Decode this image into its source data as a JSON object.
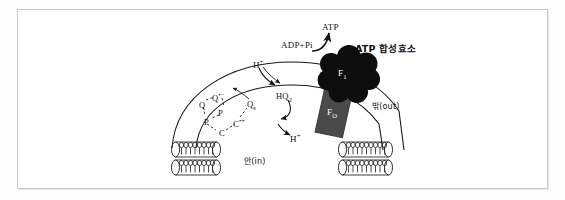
{
  "figure": {
    "frame": {
      "border_color": "#c9c9c9",
      "background": "#ffffff"
    }
  },
  "labels": {
    "atp": "ATP",
    "adp_pi": "ADP+Pi",
    "atp_synthase": "ATP 합성효소",
    "f1": "F",
    "f1_sub": "1",
    "f0": "F",
    "f0_sub": "O",
    "h_plus_top": "H",
    "h_plus_top_sup": "+",
    "h_plus_bottom": "H",
    "h_plus_bottom_sup": "+",
    "hq2": "HQ",
    "hq2_sub": "2",
    "qs": "Q",
    "qs_sub": "s",
    "q": "Q",
    "q_radical": "Q",
    "q_radical_sup": "•−",
    "p_upper": "P",
    "p_lower": "P",
    "c": "C",
    "c_radical": "C",
    "c_radical_sup": "•+",
    "outside": "밖(out)",
    "inside": "안(in)"
  },
  "colors": {
    "f1_fill": "#0d0d0d",
    "f0_fill": "#4a4a4a",
    "stroke": "#1a1a1a",
    "membrane_stroke": "#2b2b2b",
    "frame": "#c9c9c9",
    "background": "#ffffff",
    "label_text": "#111111",
    "label_text_on_dark": "#ffffff"
  },
  "diagram": {
    "type": "biology-membrane-schematic",
    "components": [
      "outer-membrane-arc",
      "inner-membrane-arc",
      "lipid-bilayer-left",
      "lipid-bilayer-right",
      "atp-synthase-f1-head",
      "atp-synthase-f0-stalk",
      "q-cycle-electron-chain",
      "proton-flow-arrows",
      "atp-synthesis-arrow"
    ],
    "q_cycle_chain": [
      "Q",
      "Q•−",
      "P",
      "P",
      "C",
      "C•+",
      "Qs",
      "HQ2"
    ],
    "arrows": [
      {
        "name": "adp-to-atp",
        "from": "ADP+Pi",
        "to": "ATP"
      },
      {
        "name": "proton-in-top",
        "from": "H+ (out)",
        "to": "HQ2"
      },
      {
        "name": "proton-out-bottom",
        "from": "inner membrane",
        "to": "H+ (in)"
      },
      {
        "name": "hq2-to-qs",
        "from": "HQ2",
        "to": "Qs"
      },
      {
        "name": "qs-to-hplus",
        "from": "Qs",
        "to": "H+"
      }
    ]
  }
}
